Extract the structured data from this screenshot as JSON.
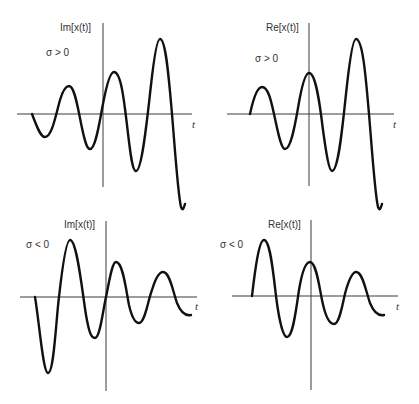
{
  "panels": [
    {
      "id": "top-left",
      "ylabel": "Im[x(t)]",
      "condition": "σ > 0",
      "xlabel": "t",
      "description": "Growing oscillation (imaginary part), starts at zero going negative"
    },
    {
      "id": "top-right",
      "ylabel": "Re[x(t)]",
      "condition": "σ > 0",
      "xlabel": "t",
      "description": "Growing oscillation (real part), starts at zero going positive"
    },
    {
      "id": "bottom-left",
      "ylabel": "Im[x(t)]",
      "condition": "σ < 0",
      "xlabel": "t",
      "description": "Decaying oscillation (imaginary part), starts at zero going negative"
    },
    {
      "id": "bottom-right",
      "ylabel": "Re[x(t)]",
      "condition": "σ < 0",
      "xlabel": "t",
      "description": "Decaying oscillation (real part), starts at zero going positive"
    }
  ]
}
